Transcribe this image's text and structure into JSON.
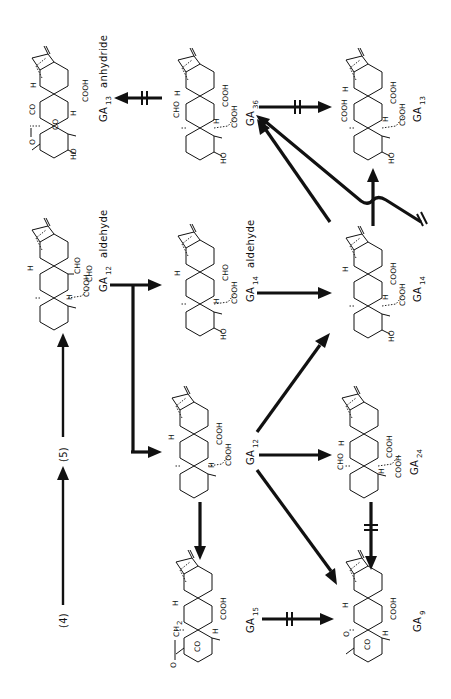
{
  "diagram": {
    "orientation": "rotated-90-ccw",
    "precursors": [
      {
        "id": "p4",
        "label": "(4)"
      },
      {
        "id": "p5",
        "label": "(5)"
      }
    ],
    "compounds": [
      {
        "id": "ga12_aldehyde",
        "name": "GA",
        "subscript": "12",
        "suffix": "aldehyde",
        "groups": [
          "CHO",
          "COOH",
          "H",
          "H"
        ]
      },
      {
        "id": "ga14_aldehyde",
        "name": "GA",
        "subscript": "14",
        "suffix": "aldehyde",
        "groups": [
          "CHO",
          "COOH",
          "H",
          "H",
          "HO"
        ]
      },
      {
        "id": "ga14",
        "name": "GA",
        "subscript": "14",
        "suffix": "",
        "groups": [
          "COOH",
          "COOH",
          "H",
          "H",
          "HO"
        ]
      },
      {
        "id": "ga36",
        "name": "GA",
        "subscript": "36",
        "suffix": "",
        "groups": [
          "CHO",
          "COOH",
          "COOH",
          "H",
          "H",
          "HO"
        ]
      },
      {
        "id": "ga13_anhydride",
        "name": "GA",
        "subscript": "13",
        "suffix": "anhydride",
        "groups": [
          "O",
          "CO",
          "CO",
          "COOH",
          "H",
          "H",
          "HO"
        ]
      },
      {
        "id": "ga13",
        "name": "GA",
        "subscript": "13",
        "suffix": "",
        "groups": [
          "COOH",
          "COOH",
          "COOH",
          "H",
          "H",
          "HO"
        ]
      },
      {
        "id": "ga12",
        "name": "GA",
        "subscript": "12",
        "suffix": "",
        "groups": [
          "COOH",
          "COOH",
          "H",
          "H"
        ]
      },
      {
        "id": "ga24",
        "name": "GA",
        "subscript": "24",
        "suffix": "",
        "groups": [
          "CHO",
          "COOH",
          "COOH",
          "H",
          "H"
        ]
      },
      {
        "id": "ga15",
        "name": "GA",
        "subscript": "15",
        "suffix": "",
        "groups": [
          "O",
          "CH2",
          "CO",
          "COOH",
          "H",
          "H"
        ]
      },
      {
        "id": "ga9",
        "name": "GA",
        "subscript": "9",
        "suffix": "",
        "groups": [
          "O",
          "CO",
          "COOH",
          "H",
          "H"
        ]
      }
    ],
    "edges": [
      {
        "from": "p4",
        "to": "p5",
        "blocked": false
      },
      {
        "from": "p5",
        "to": "ga12_aldehyde",
        "blocked": false
      },
      {
        "from": "ga12_aldehyde",
        "to": "ga14_aldehyde",
        "blocked": false
      },
      {
        "from": "ga12_aldehyde",
        "to": "ga12",
        "blocked": false
      },
      {
        "from": "ga14_aldehyde",
        "to": "ga14",
        "blocked": false
      },
      {
        "from": "ga36",
        "to": "ga13_anhydride",
        "blocked": true
      },
      {
        "from": "ga36",
        "to": "ga13",
        "blocked": true
      },
      {
        "from": "ga14",
        "to": "ga36",
        "blocked": false
      },
      {
        "from": "ga14",
        "to": "ga13",
        "blocked": false
      },
      {
        "from": "external",
        "to": "ga36",
        "blocked": true
      },
      {
        "from": "ga12",
        "to": "ga14",
        "blocked": false
      },
      {
        "from": "ga12",
        "to": "ga24",
        "blocked": false
      },
      {
        "from": "ga12",
        "to": "ga9",
        "blocked": false
      },
      {
        "from": "ga12",
        "to": "ga15",
        "blocked": false
      },
      {
        "from": "ga15",
        "to": "ga9",
        "blocked": true
      },
      {
        "from": "ga24",
        "to": "ga9",
        "blocked": true
      }
    ]
  },
  "labels": {
    "p4": "(4)",
    "p5": "(5)",
    "ga": "GA",
    "sub12": "12",
    "sub14": "14",
    "sub36": "36",
    "sub13": "13",
    "sub24": "24",
    "sub15": "15",
    "sub9": "9",
    "aldehyde": "aldehyde",
    "anhydride": "anhydride",
    "CHO": "CHO",
    "COOH": "COOH",
    "H": "H",
    "HO": "HO",
    "CO": "CO",
    "O": "O",
    "CH2": "CH",
    "sub2": "2"
  }
}
